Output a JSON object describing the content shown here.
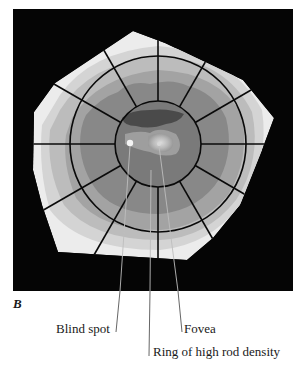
{
  "figure": {
    "panel_letter": "B",
    "colors": {
      "background": "#ffffff",
      "frame": "#050505",
      "level_1": "#e6e6e6",
      "level_2": "#cdcdcd",
      "level_3": "#b4b4b4",
      "level_4": "#999999",
      "level_5": "#7f7f7f",
      "level_6": "#666666",
      "level_7": "#4a4a4a",
      "fovea_glow": "#c8c8c8",
      "grid": "#0a0a0a"
    }
  },
  "labels": {
    "blind_spot": "Blind spot",
    "fovea": "Fovea",
    "ring": "Ring of high rod density"
  }
}
